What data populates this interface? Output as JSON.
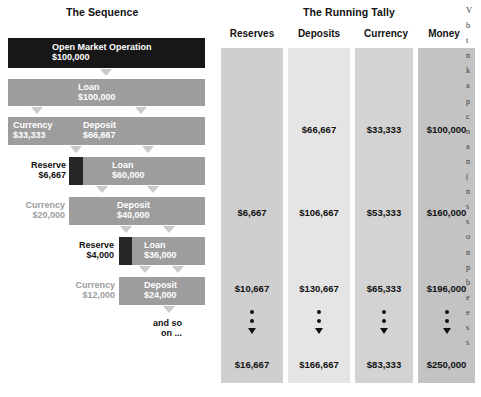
{
  "figure": {
    "left_title": "The Sequence",
    "right_title": "The Running Tally"
  },
  "chart_data": {
    "type": "table",
    "title": "The Running Tally",
    "columns": [
      "Reserves",
      "Deposits",
      "Currency",
      "Money"
    ],
    "rows": [
      {
        "Reserves": "",
        "Deposits": "$66,667",
        "Currency": "$33,333",
        "Money": "$100,000"
      },
      {
        "Reserves": "$6,667",
        "Deposits": "$106,667",
        "Currency": "$53,333",
        "Money": "$160,000"
      },
      {
        "Reserves": "$10,667",
        "Deposits": "$130,667",
        "Currency": "$65,333",
        "Money": "$196,000"
      },
      {
        "Reserves": "$16,667",
        "Deposits": "$166,667",
        "Currency": "$83,333",
        "Money": "$250,000"
      }
    ],
    "ellipsis_marker": "two dots then down triangle",
    "sequence_steps": [
      {
        "label": "Open Market Operation",
        "amount": "$100,000"
      },
      {
        "label": "Loan",
        "amount": "$100,000"
      },
      {
        "label": "Currency",
        "amount": "$33,333"
      },
      {
        "label": "Deposit",
        "amount": "$66,667"
      },
      {
        "label": "Reserve",
        "amount": "$6,667"
      },
      {
        "label": "Loan",
        "amount": "$60,000"
      },
      {
        "label": "Currency",
        "amount": "$20,000"
      },
      {
        "label": "Deposit",
        "amount": "$40,000"
      },
      {
        "label": "Reserve",
        "amount": "$4,000"
      },
      {
        "label": "Loan",
        "amount": "$36,000"
      },
      {
        "label": "Currency",
        "amount": "$12,000"
      },
      {
        "label": "Deposit",
        "amount": "$24,000"
      },
      {
        "label": "and so on ...",
        "amount": ""
      }
    ]
  },
  "sequence": {
    "r1": {
      "label": "Open Market Operation",
      "amount": "$100,000"
    },
    "r2": {
      "label": "Loan",
      "amount": "$100,000"
    },
    "r3a": {
      "label": "Currency",
      "amount": "$33,333"
    },
    "r3b": {
      "label": "Deposit",
      "amount": "$66,667"
    },
    "r4a": {
      "label": "Reserve",
      "amount": "$6,667"
    },
    "r4b": {
      "label": "Loan",
      "amount": "$60,000"
    },
    "r5a": {
      "label": "Currency",
      "amount": "$20,000"
    },
    "r5b": {
      "label": "Deposit",
      "amount": "$40,000"
    },
    "r6a": {
      "label": "Reserve",
      "amount": "$4,000"
    },
    "r6b": {
      "label": "Loan",
      "amount": "$36,000"
    },
    "r7a": {
      "label": "Currency",
      "amount": "$12,000"
    },
    "r7b": {
      "label": "Deposit",
      "amount": "$24,000"
    },
    "ending": {
      "line1": "and so",
      "line2": "on ..."
    }
  },
  "tally": {
    "columns": [
      {
        "header": "Reserves",
        "values": [
          "",
          "$6,667",
          "$10,667",
          "$16,667"
        ]
      },
      {
        "header": "Deposits",
        "values": [
          "$66,667",
          "$106,667",
          "$130,667",
          "$166,667"
        ]
      },
      {
        "header": "Currency",
        "values": [
          "$33,333",
          "$53,333",
          "$65,333",
          "$83,333"
        ]
      },
      {
        "header": "Money",
        "values": [
          "$100,000",
          "$160,000",
          "$196,000",
          "$250,000"
        ]
      }
    ]
  },
  "margin_text": {
    "lines": [
      "V",
      "b",
      "t",
      "n",
      "k",
      "a",
      "p",
      "c",
      "n",
      "a",
      "n",
      "(",
      "n",
      "s",
      "s",
      "o",
      "n",
      "p",
      "b",
      "e",
      "e",
      "s",
      "s"
    ]
  },
  "colors": {
    "bar_dark": "#171717",
    "bar_gray": "#9d9d9d",
    "arrow_gray": "#c9c9c9",
    "tally_reserves": "#cfcfcf",
    "tally_deposits": "#e3e3e3",
    "tally_currency": "#d2d2d2",
    "tally_money": "#c2c2c2",
    "text_dark": "#111111",
    "text_light": "#ffffff"
  }
}
